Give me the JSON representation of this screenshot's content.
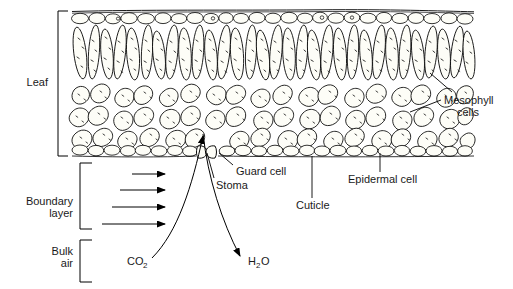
{
  "figure": {
    "background_color": "#ffffff",
    "line_color": "#000000",
    "cell_fill_color": "#fdfdf7",
    "stipple_color": "#333333"
  },
  "brackets": [
    {
      "name": "leaf",
      "label": "Leaf",
      "label_lines": [
        "Leaf"
      ]
    },
    {
      "name": "boundary-layer",
      "label": "Boundary layer",
      "label_lines": [
        "Boundary",
        "layer"
      ]
    },
    {
      "name": "bulk-air",
      "label": "Bulk air",
      "label_lines": [
        "Bulk",
        "air"
      ]
    }
  ],
  "callouts": [
    {
      "name": "mesophyll-cells",
      "label_lines": [
        "Mesophyll",
        "cells"
      ]
    },
    {
      "name": "guard-cell",
      "label": "Guard cell"
    },
    {
      "name": "stoma",
      "label": "Stoma"
    },
    {
      "name": "cuticle",
      "label": "Cuticle"
    },
    {
      "name": "epidermal-cell",
      "label": "Epidermal cell"
    }
  ],
  "flux_labels": {
    "co2": {
      "base": "CO",
      "sub": "2",
      "direction": "into leaf"
    },
    "h2o": {
      "base": "H",
      "sub": "2",
      "tail": "O",
      "direction": "out of leaf"
    }
  },
  "wind_arrows": {
    "name": "boundary-layer-wind-arrows",
    "count": 4,
    "description": "Horizontal arrows of increasing length showing wind speed gradient across the boundary layer",
    "lengths_px": [
      33,
      45,
      53,
      63
    ]
  },
  "tissue_layers": [
    {
      "name": "cuticle-line",
      "description": "thin outer line over upper epidermis"
    },
    {
      "name": "upper-epidermis",
      "description": "row of oval epidermal cells"
    },
    {
      "name": "palisade-mesophyll",
      "description": "row of elongated vertical cells"
    },
    {
      "name": "spongy-mesophyll",
      "description": "irregular loosely packed cells with air spaces"
    },
    {
      "name": "lower-epidermis",
      "description": "row of oval epidermal cells broken by a stoma"
    }
  ]
}
